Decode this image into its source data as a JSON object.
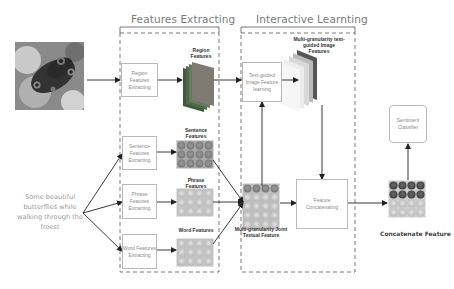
{
  "sections": {
    "features_extracting": "Features Extracting",
    "interactive_learning": "Interactive Learnting"
  },
  "input": {
    "image_alt": "butterfly photo",
    "text": "Some beautiful butterflies while walking through the froest"
  },
  "modules": {
    "region_extract": "Region Features Extracting",
    "sentence_extract": "Sentence Features Extracting",
    "phrase_extract": "Phrase Features Extracting",
    "word_extract": "Word Features Extracting",
    "text_guided": "Text-guided Image Feature learning",
    "feature_concat": "Feature Concatenating",
    "classifier": "Sentiment Classifier"
  },
  "feature_labels": {
    "region": "Region Features",
    "sentence": "Sentence Features",
    "phrase": "Phrase Features",
    "word": "Word Features",
    "multi_image": "Multi-granularity text-guided Image Features",
    "joint_textual": "Multi-granularity Joint Textual Feature",
    "concatenate": "Concatenate Feature"
  },
  "colors": {
    "dark_dot": "#555555",
    "mid_dot": "#8c8c8c",
    "light_dot": "#bdbdbd",
    "region_stack": "#5b6e52",
    "border": "#b8b8b8"
  }
}
